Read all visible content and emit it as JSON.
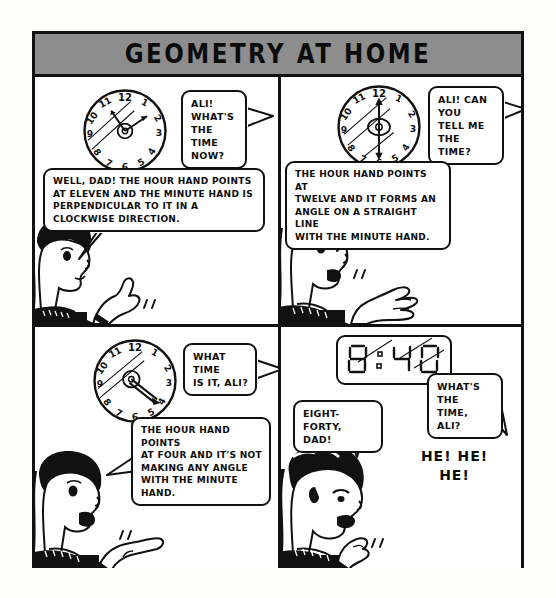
{
  "comic": {
    "title": "GEOMETRY AT HOME",
    "title_bar_color": "#8d8d8d",
    "ink_color": "#111111",
    "paper_color": "#ffffff",
    "panels": [
      {
        "id": "panel-1",
        "position": "top-left",
        "clock": {
          "type": "analog",
          "numerals": [
            "12",
            "1",
            "2",
            "3",
            "4",
            "5",
            "6",
            "7",
            "8",
            "9",
            "10",
            "11"
          ],
          "hour_hand_points_at": 11,
          "minute_hand_points_at": 2,
          "reads": "11:10"
        },
        "bubbles": [
          {
            "speaker": "dad",
            "text": "ALI!\nWHAT'S\nTHE TIME\nNOW?"
          },
          {
            "speaker": "ali",
            "text": "WELL, DAD! THE HOUR HAND POINTS\nAT ELEVEN AND THE MINUTE HAND IS\nPERPENDICULAR TO IT IN A\nCLOCKWISE DIRECTION."
          }
        ],
        "character": "boy-pointing-up"
      },
      {
        "id": "panel-2",
        "position": "top-right",
        "clock": {
          "type": "analog",
          "numerals": [
            "12",
            "1",
            "2",
            "3",
            "4",
            "5",
            "6",
            "7",
            "8",
            "9",
            "10",
            "11"
          ],
          "hour_hand_points_at": 12,
          "minute_hand_points_at": 6,
          "reads": "12:30"
        },
        "bubbles": [
          {
            "speaker": "dad",
            "text": "ALI! CAN YOU\nTELL ME THE\nTIME?"
          },
          {
            "speaker": "ali",
            "text": "THE HOUR HAND POINTS AT\nTWELVE AND IT FORMS AN\nANGLE ON A STRAIGHT LINE\nWITH THE MINUTE HAND."
          }
        ],
        "character": "boy-open-palm"
      },
      {
        "id": "panel-3",
        "position": "bottom-left",
        "clock": {
          "type": "analog",
          "numerals": [
            "12",
            "1",
            "2",
            "3",
            "4",
            "5",
            "6",
            "7",
            "8",
            "9",
            "10",
            "11"
          ],
          "hour_hand_points_at": 4,
          "minute_hand_points_at": 4,
          "reads": "4:20"
        },
        "bubbles": [
          {
            "speaker": "dad",
            "text": "WHAT TIME\nIS IT, ALI?"
          },
          {
            "speaker": "ali",
            "text": "THE HOUR HAND POINTS\nAT FOUR AND IT'S NOT\nMAKING ANY ANGLE\nWITH THE MINUTE HAND."
          }
        ],
        "character": "boy-pointing-finger"
      },
      {
        "id": "panel-4",
        "position": "bottom-right",
        "clock": {
          "type": "digital",
          "display": "8:40",
          "reads": "8:40"
        },
        "bubbles": [
          {
            "speaker": "dad",
            "text": "WHAT'S THE\nTIME, ALI?"
          },
          {
            "speaker": "ali",
            "text": "EIGHT-FORTY,\nDAD!"
          }
        ],
        "laughter": "HE! HE!\nHE!",
        "character": "boy-laughing"
      }
    ]
  }
}
